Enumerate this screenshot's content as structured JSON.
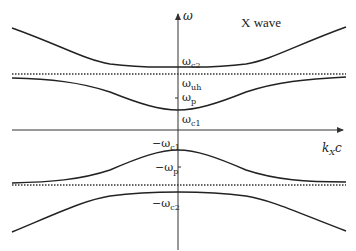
{
  "diagram": {
    "title": "X wave",
    "axes": {
      "y_label": "ω",
      "x_label_main": "k",
      "x_label_sub": "X",
      "x_label_tail": "c"
    },
    "labels": {
      "wc2": {
        "main": "ω",
        "sub": "c2"
      },
      "wuh": {
        "main": "ω",
        "sub": "uh"
      },
      "wp": {
        "main": "ω",
        "sub": "p"
      },
      "wc1": {
        "main": "ω",
        "sub": "c1"
      },
      "neg_wc1": {
        "main": "−ω",
        "sub": "c1"
      },
      "neg_wp": {
        "main": "−ω",
        "sub": "p"
      },
      "neg_wc2": {
        "main": "−ω",
        "sub": "c2"
      }
    },
    "branches": [
      "upper high-frequency branch (asymptote ωc2 at k=0)",
      "upper low-frequency branch (ωc1 at k=0, approaching ωuh)",
      "lower low-frequency branch (−ωc1 at k=0, approaching −ωuh)",
      "lower high-frequency branch (−ωc2 at k=0)"
    ],
    "asymptotes": [
      "ωuh (dotted)",
      "−ωuh (dotted)"
    ],
    "colors": {
      "curve": "#222222",
      "axis": "#333333",
      "dotted": "#333333"
    }
  }
}
